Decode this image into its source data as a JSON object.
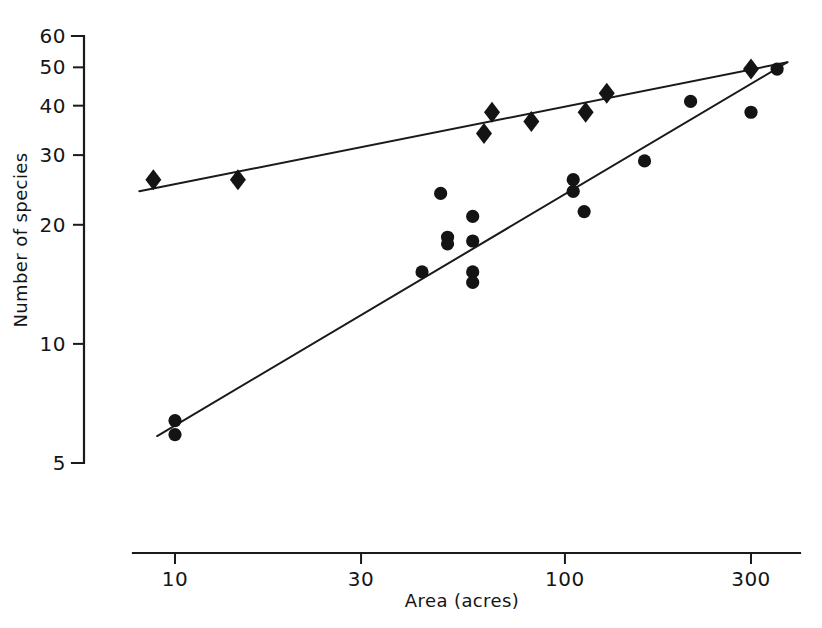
{
  "chart_data": {
    "type": "scatter",
    "title": "",
    "xlabel": "Area (acres)",
    "ylabel": "Number of species",
    "xscale": "log",
    "yscale": "log",
    "xlim": [
      8,
      380
    ],
    "ylim": [
      5,
      60
    ],
    "grid": false,
    "legend": null,
    "xticks": [
      10,
      30,
      100,
      300
    ],
    "xtick_labels": [
      "10",
      "30",
      "100",
      "300"
    ],
    "yticks": [
      5,
      10,
      20,
      30,
      40,
      50,
      60
    ],
    "ytick_labels": [
      "5",
      "10",
      "20",
      "30",
      "40",
      "50",
      "60"
    ],
    "series": [
      {
        "name": "upper-series",
        "marker": "diamond",
        "points": [
          {
            "x": 8.8,
            "y": 26
          },
          {
            "x": 14.5,
            "y": 26
          },
          {
            "x": 62,
            "y": 34
          },
          {
            "x": 65,
            "y": 38.5
          },
          {
            "x": 82,
            "y": 36.5
          },
          {
            "x": 113,
            "y": 38.5
          },
          {
            "x": 128,
            "y": 43
          },
          {
            "x": 300,
            "y": 49.5
          }
        ],
        "fit_line": {
          "x_start": 8.1,
          "y_start": 24.3,
          "x_end": 372,
          "y_end": 51.5
        }
      },
      {
        "name": "lower-series",
        "marker": "circle",
        "points": [
          {
            "x": 10,
            "y": 6.4
          },
          {
            "x": 10,
            "y": 5.9
          },
          {
            "x": 43,
            "y": 15.2
          },
          {
            "x": 48,
            "y": 24
          },
          {
            "x": 50,
            "y": 18.6
          },
          {
            "x": 50,
            "y": 17.9
          },
          {
            "x": 58,
            "y": 21
          },
          {
            "x": 58,
            "y": 18.2
          },
          {
            "x": 58,
            "y": 15.2
          },
          {
            "x": 58,
            "y": 14.3
          },
          {
            "x": 105,
            "y": 26
          },
          {
            "x": 105,
            "y": 24.3
          },
          {
            "x": 112,
            "y": 21.6
          },
          {
            "x": 160,
            "y": 29
          },
          {
            "x": 210,
            "y": 41
          },
          {
            "x": 300,
            "y": 38.5
          },
          {
            "x": 350,
            "y": 49.5
          }
        ],
        "fit_line": {
          "x_start": 9.0,
          "y_start": 5.85,
          "x_end": 372,
          "y_end": 51.5
        }
      }
    ]
  }
}
